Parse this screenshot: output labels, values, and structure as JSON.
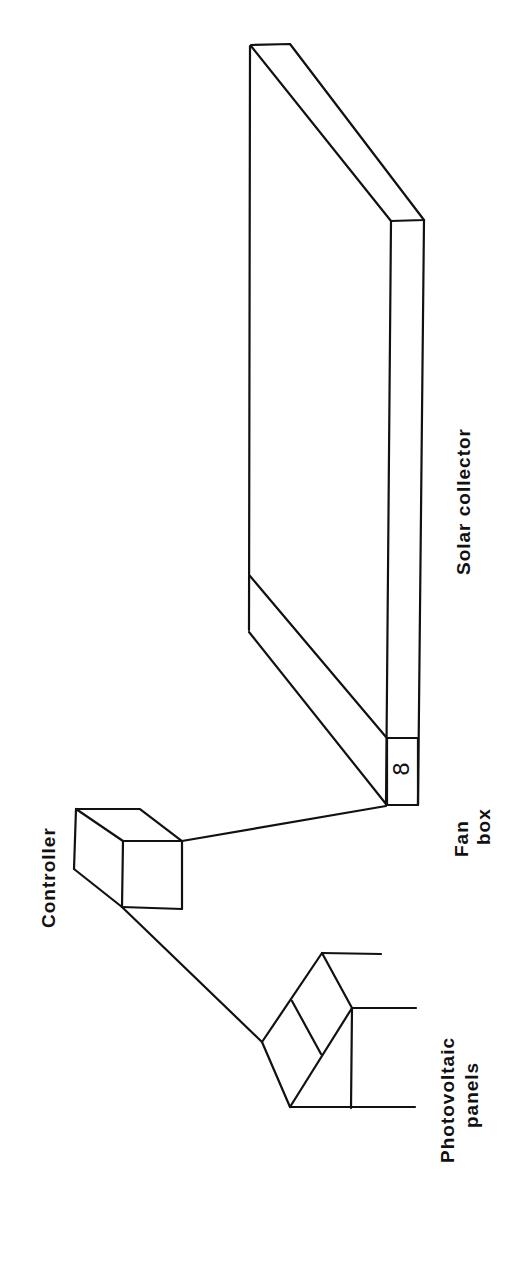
{
  "diagram": {
    "type": "schematic",
    "orientation": "rotated-90-ccw",
    "background": "#ffffff",
    "line_color": "#111111",
    "components": {
      "solar_collector": {
        "label": "Solar collector"
      },
      "fan_box": {
        "label_line1": "Fan",
        "label_line2": "box",
        "symbol": "8"
      },
      "controller": {
        "label": "Controller"
      },
      "photovoltaic_panels": {
        "label_line1": "Photovoltaic",
        "label_line2": "panels"
      }
    },
    "connections": [
      {
        "from": "photovoltaic_panels",
        "to": "controller"
      },
      {
        "from": "controller",
        "to": "fan_box"
      },
      {
        "from": "fan_box",
        "to": "solar_collector"
      }
    ]
  }
}
